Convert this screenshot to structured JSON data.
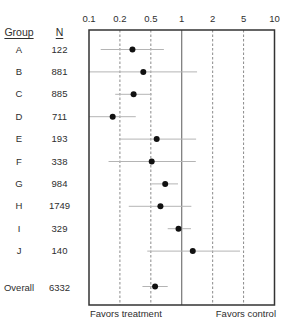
{
  "chart_data": {
    "type": "scatter",
    "subtype": "forest_plot",
    "title": "",
    "xlabel": "",
    "ylabel": "",
    "xscale": "log",
    "xlim": [
      0.1,
      10
    ],
    "x_ticks": [
      0.1,
      0.2,
      0.5,
      1,
      2,
      5,
      10
    ],
    "x_tick_labels": [
      "0.1",
      "0.2",
      "0.5",
      "1",
      "2",
      "5",
      "10"
    ],
    "reference_line": 1,
    "dashed_gridlines": [
      0.2,
      0.5,
      2,
      5
    ],
    "grid": true,
    "legend": null,
    "columns": {
      "group": "Group",
      "n": "N"
    },
    "rows": [
      {
        "group": "A",
        "n": "122",
        "estimate": 0.29,
        "ci_low": 0.13,
        "ci_high": 0.67
      },
      {
        "group": "B",
        "n": "881",
        "estimate": 0.4,
        "ci_low": 0.1,
        "ci_high": 1.41
      },
      {
        "group": "C",
        "n": "885",
        "estimate": 0.3,
        "ci_low": 0.18,
        "ci_high": 0.51
      },
      {
        "group": "D",
        "n": "711",
        "estimate": 0.17,
        "ci_low": 0.1,
        "ci_high": 0.32
      },
      {
        "group": "E",
        "n": "193",
        "estimate": 0.57,
        "ci_low": 0.2,
        "ci_high": 1.38
      },
      {
        "group": "F",
        "n": "338",
        "estimate": 0.51,
        "ci_low": 0.155,
        "ci_high": 1.37
      },
      {
        "group": "G",
        "n": "984",
        "estimate": 0.69,
        "ci_low": 0.51,
        "ci_high": 0.92
      },
      {
        "group": "H",
        "n": "1749",
        "estimate": 0.62,
        "ci_low": 0.26,
        "ci_high": 1.24
      },
      {
        "group": "I",
        "n": "329",
        "estimate": 0.93,
        "ci_low": 0.73,
        "ci_high": 1.23
      },
      {
        "group": "J",
        "n": "140",
        "estimate": 1.28,
        "ci_low": 0.45,
        "ci_high": 4.5
      }
    ],
    "overall": {
      "group": "Overall",
      "n": "6332",
      "estimate": 0.55,
      "ci_low": 0.39,
      "ci_high": 0.73
    },
    "annotations": {
      "left": "Favors treatment",
      "right": "Favors control"
    },
    "colors": {
      "frame": "#333333",
      "reference_line": "#5a5a5a",
      "dashed_gridline": "#8a8a8a",
      "ci_line": "#b4b4b4",
      "point": "#111111",
      "text": "#2e2e2e"
    }
  }
}
